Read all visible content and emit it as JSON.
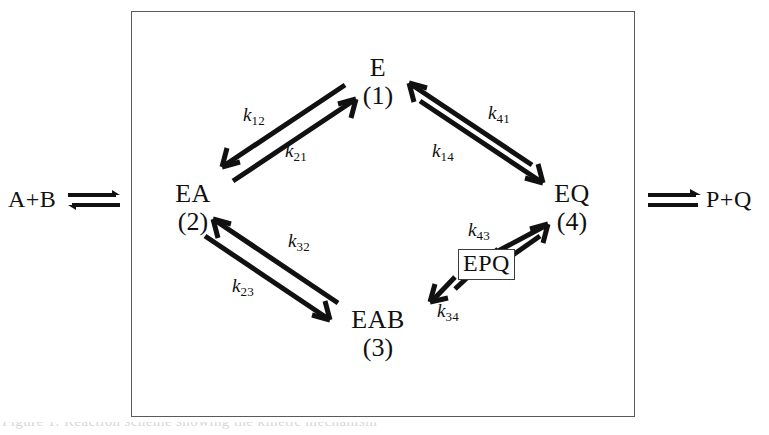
{
  "figure": {
    "type": "reaction-scheme"
  },
  "reagents": {
    "input_label": "A+B",
    "output_label": "P+Q",
    "input_arrow_icon": "reversible-arrow-icon",
    "output_arrow_icon": "reversible-arrow-icon"
  },
  "nodes": [
    {
      "id": "E",
      "symbol": "E",
      "number": "(1)"
    },
    {
      "id": "EA",
      "symbol": "EA",
      "number": "(2)"
    },
    {
      "id": "EAB",
      "symbol": "EAB",
      "number": "(3)"
    },
    {
      "id": "EQ",
      "symbol": "EQ",
      "number": "(4)"
    }
  ],
  "intermediate": {
    "id": "EPQ",
    "symbol": "EPQ",
    "boxed": true
  },
  "rates": [
    {
      "id": "k12",
      "k": "k",
      "sub": "12",
      "from": "E",
      "to": "EA"
    },
    {
      "id": "k21",
      "k": "k",
      "sub": "21",
      "from": "EA",
      "to": "E"
    },
    {
      "id": "k41",
      "k": "k",
      "sub": "41",
      "from": "EQ",
      "to": "E"
    },
    {
      "id": "k14",
      "k": "k",
      "sub": "14",
      "from": "E",
      "to": "EQ"
    },
    {
      "id": "k32",
      "k": "k",
      "sub": "32",
      "from": "EAB",
      "to": "EA"
    },
    {
      "id": "k23",
      "k": "k",
      "sub": "23",
      "from": "EA",
      "to": "EAB"
    },
    {
      "id": "k43",
      "k": "k",
      "sub": "43",
      "from": "EQ",
      "to": "EPQ"
    },
    {
      "id": "k34",
      "k": "k",
      "sub": "34",
      "from": "EPQ",
      "to": "EAB"
    }
  ],
  "caption": {
    "text": "Figure 1. Reaction scheme showing the kinetic mechanism"
  },
  "colors": {
    "ink": "#111111",
    "frame": "#5a5a5a",
    "background": "#ffffff"
  }
}
